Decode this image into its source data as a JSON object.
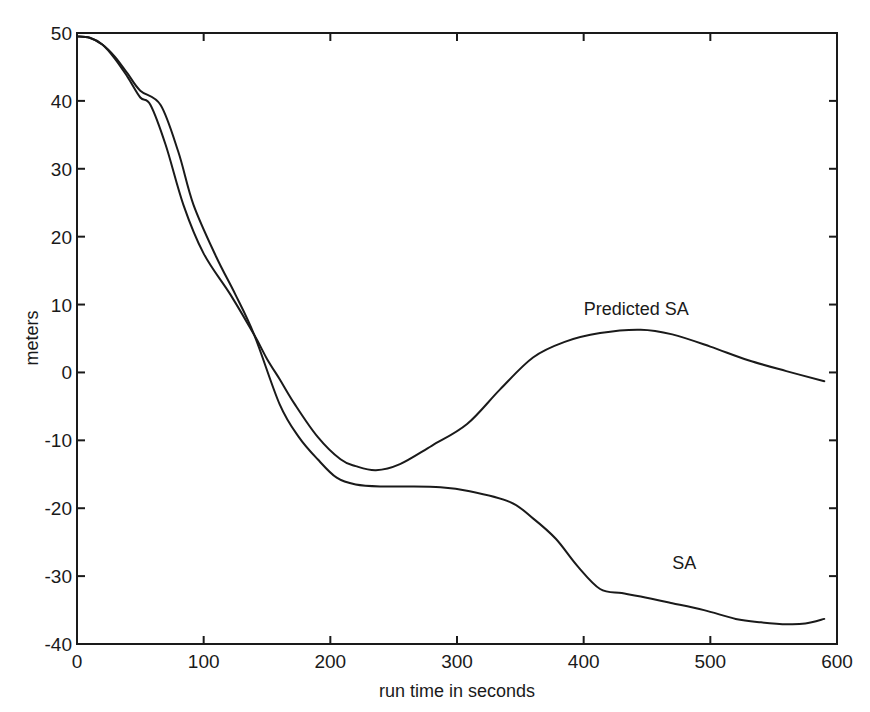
{
  "chart_data": {
    "type": "line",
    "title": "",
    "xlabel": "run time in seconds",
    "ylabel": "meters",
    "xlim": [
      0,
      600
    ],
    "ylim": [
      -40,
      50
    ],
    "xticks": [
      0,
      100,
      200,
      300,
      400,
      500,
      600
    ],
    "yticks": [
      50,
      40,
      30,
      20,
      10,
      0,
      -10,
      -20,
      -30,
      -40
    ],
    "grid": false,
    "legend": "none (inline annotations)",
    "annotations": [
      {
        "text": "Predicted SA",
        "x": 400,
        "y": 8.5
      },
      {
        "text": "SA",
        "x": 470,
        "y": -29
      }
    ],
    "series": [
      {
        "name": "SA",
        "x": [
          0,
          10,
          20,
          30,
          40,
          50,
          66,
          80,
          92,
          110,
          125,
          140,
          160,
          175,
          190,
          205,
          220,
          240,
          260,
          287,
          310,
          342,
          360,
          378,
          395,
          413,
          430,
          445,
          470,
          495,
          520,
          540,
          561,
          575,
          590
        ],
        "y": [
          49.5,
          49.3,
          48.3,
          46.5,
          44,
          41.5,
          39.4,
          32.5,
          24.7,
          17,
          11.5,
          5.5,
          -4.7,
          -9.5,
          -12.8,
          -15.5,
          -16.5,
          -16.8,
          -16.8,
          -16.9,
          -17.5,
          -19.1,
          -21.5,
          -24.5,
          -28.5,
          -31.9,
          -32.5,
          -33,
          -34,
          -35,
          -36.3,
          -36.8,
          -37.1,
          -37,
          -36.3
        ]
      },
      {
        "name": "Predicted SA",
        "x": [
          0,
          10,
          20,
          30,
          40,
          50,
          58,
          70,
          84,
          100,
          121,
          140,
          150,
          160,
          172,
          190,
          208,
          220,
          236,
          255,
          280,
          308,
          334,
          360,
          385,
          413,
          445,
          470,
          500,
          530,
          560,
          590
        ],
        "y": [
          49.5,
          49.3,
          48.3,
          46.2,
          43.5,
          40.5,
          39.4,
          33.5,
          24.7,
          17.5,
          11.5,
          5.5,
          2,
          -1,
          -4.7,
          -9.5,
          -12.8,
          -13.8,
          -14.4,
          -13.5,
          -10.8,
          -7.6,
          -2.5,
          2.2,
          4.5,
          5.8,
          6.3,
          5.6,
          3.8,
          1.8,
          0.2,
          -1.3
        ]
      }
    ]
  }
}
